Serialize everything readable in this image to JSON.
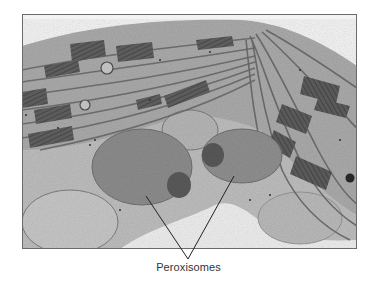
{
  "figure": {
    "type": "electron-micrograph",
    "label": "Peroxisomes",
    "pointer_count": 2,
    "colors": {
      "background": "#ffffff",
      "frame_border": "#6b6b6b",
      "cytoplasm": "#a9a9a9",
      "thylakoid_dark": "#5e5e5e",
      "peroxisome": "#8a8a8a",
      "peroxisome_core": "#5a5a5a",
      "vacuole": "#ececec",
      "label_text": "#333333"
    }
  }
}
